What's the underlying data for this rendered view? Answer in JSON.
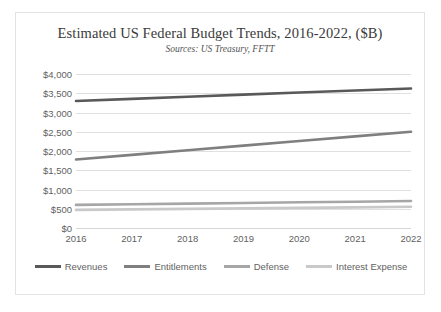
{
  "chart_data": {
    "type": "line",
    "title": "Estimated US Federal Budget Trends, 2016-2022, ($B)",
    "subtitle": "Sources: US Treasury, FFTT",
    "xlabel": "",
    "ylabel": "",
    "x": [
      "2016",
      "2017",
      "2018",
      "2019",
      "2020",
      "2021",
      "2022"
    ],
    "categories": [
      "2016",
      "2017",
      "2018",
      "2019",
      "2020",
      "2021",
      "2022"
    ],
    "ylim": [
      0,
      4000
    ],
    "ytick_values": [
      4000,
      3500,
      3000,
      2500,
      2000,
      1500,
      1000,
      500,
      0
    ],
    "ytick_labels": [
      "$4,000",
      "$3,500",
      "$3,000",
      "$2,500",
      "$2,000",
      "$1,500",
      "$1,000",
      "$500",
      "$0"
    ],
    "grid": true,
    "legend_position": "bottom",
    "series": [
      {
        "name": "Revenues",
        "color": "#595959",
        "values": [
          3300,
          3355,
          3410,
          3465,
          3520,
          3570,
          3625
        ]
      },
      {
        "name": "Entitlements",
        "color": "#7f7f7f",
        "values": [
          1780,
          1900,
          2020,
          2140,
          2260,
          2380,
          2500
        ]
      },
      {
        "name": "Defense",
        "color": "#a6a6a6",
        "values": [
          600,
          617,
          633,
          650,
          667,
          683,
          700
        ]
      },
      {
        "name": "Interest Expense",
        "color": "#c9c9c9",
        "values": [
          470,
          483,
          497,
          510,
          523,
          537,
          550
        ]
      }
    ]
  },
  "legend": {
    "items": [
      {
        "label": "Revenues"
      },
      {
        "label": "Entitlements"
      },
      {
        "label": "Defense"
      },
      {
        "label": "Interest Expense"
      }
    ]
  }
}
